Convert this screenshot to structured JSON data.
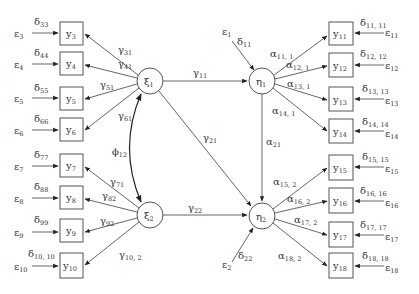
{
  "latent": {
    "xi1": {
      "label": "ξ",
      "sub": "1"
    },
    "xi2": {
      "label": "ξ",
      "sub": "2"
    },
    "eta1": {
      "label": "η",
      "sub": "1"
    },
    "eta2": {
      "label": "η",
      "sub": "2"
    }
  },
  "left_indicators": [
    {
      "y": "y",
      "ysub": "3",
      "d": "δ",
      "dsub": "33",
      "e": "ε",
      "esub": "3",
      "path": "γ",
      "psub": "31"
    },
    {
      "y": "y",
      "ysub": "4",
      "d": "δ",
      "dsub": "44",
      "e": "ε",
      "esub": "4",
      "path": "γ",
      "psub": "41"
    },
    {
      "y": "y",
      "ysub": "5",
      "d": "δ",
      "dsub": "55",
      "e": "ε",
      "esub": "5",
      "path": "γ",
      "psub": "51"
    },
    {
      "y": "y",
      "ysub": "6",
      "d": "δ",
      "dsub": "66",
      "e": "ε",
      "esub": "6",
      "path": "γ",
      "psub": "61"
    },
    {
      "y": "y",
      "ysub": "7",
      "d": "δ",
      "dsub": "77",
      "e": "ε",
      "esub": "7",
      "path": "γ",
      "psub": "71"
    },
    {
      "y": "y",
      "ysub": "8",
      "d": "δ",
      "dsub": "88",
      "e": "ε",
      "esub": "8",
      "path": "γ",
      "psub": "82"
    },
    {
      "y": "y",
      "ysub": "9",
      "d": "δ",
      "dsub": "99",
      "e": "ε",
      "esub": "9",
      "path": "γ",
      "psub": "92"
    },
    {
      "y": "y",
      "ysub": "10",
      "d": "δ",
      "dsub": "10, 10",
      "e": "ε",
      "esub": "10",
      "path": "γ",
      "psub": "10, 2"
    }
  ],
  "right_indicators": [
    {
      "y": "y",
      "ysub": "11",
      "d": "δ",
      "dsub": "11, 11",
      "e": "ε",
      "esub": "11",
      "path": "α",
      "psub": "11, 1"
    },
    {
      "y": "y",
      "ysub": "12",
      "d": "δ",
      "dsub": "12, 12",
      "e": "ε",
      "esub": "12",
      "path": "α",
      "psub": "12, 1"
    },
    {
      "y": "y",
      "ysub": "13",
      "d": "δ",
      "dsub": "13, 13",
      "e": "ε",
      "esub": "13",
      "path": "α",
      "psub": "13, 1"
    },
    {
      "y": "y",
      "ysub": "14",
      "d": "δ",
      "dsub": "14, 14",
      "e": "ε",
      "esub": "14",
      "path": "α",
      "psub": "14, 1"
    },
    {
      "y": "y",
      "ysub": "15",
      "d": "δ",
      "dsub": "15, 15",
      "e": "ε",
      "esub": "15",
      "path": "α",
      "psub": "15, 2"
    },
    {
      "y": "y",
      "ysub": "16",
      "d": "δ",
      "dsub": "16, 16",
      "e": "ε",
      "esub": "16",
      "path": "α",
      "psub": "16, 2"
    },
    {
      "y": "y",
      "ysub": "17",
      "d": "δ",
      "dsub": "17, 17",
      "e": "ε",
      "esub": "17",
      "path": "α",
      "psub": "17, 2"
    },
    {
      "y": "y",
      "ysub": "18",
      "d": "δ",
      "dsub": "18, 18",
      "e": "ε",
      "esub": "18",
      "path": "α",
      "psub": "18, 2"
    }
  ],
  "structural": {
    "g11": {
      "label": "γ",
      "sub": "11"
    },
    "g21": {
      "label": "γ",
      "sub": "21"
    },
    "g22": {
      "label": "γ",
      "sub": "22"
    },
    "a21": {
      "label": "α",
      "sub": "21"
    },
    "phi12": {
      "label": "ϕ",
      "sub": "12"
    }
  },
  "disturbances": {
    "eta1": {
      "e": "ε",
      "esub": "1",
      "d": "δ",
      "dsub": "11"
    },
    "eta2": {
      "e": "ε",
      "esub": "2",
      "d": "δ",
      "dsub": "22"
    }
  }
}
